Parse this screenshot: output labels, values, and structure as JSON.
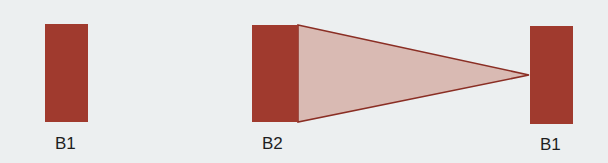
{
  "colors": {
    "background": "#eceff0",
    "block_fill": "#a03a2e",
    "cone_fill": "#d9bab3",
    "cone_stroke": "#8a2e24"
  },
  "blocks": [
    {
      "id": "left",
      "label": "B1"
    },
    {
      "id": "middle",
      "label": "B2"
    },
    {
      "id": "right",
      "label": "B1"
    }
  ]
}
